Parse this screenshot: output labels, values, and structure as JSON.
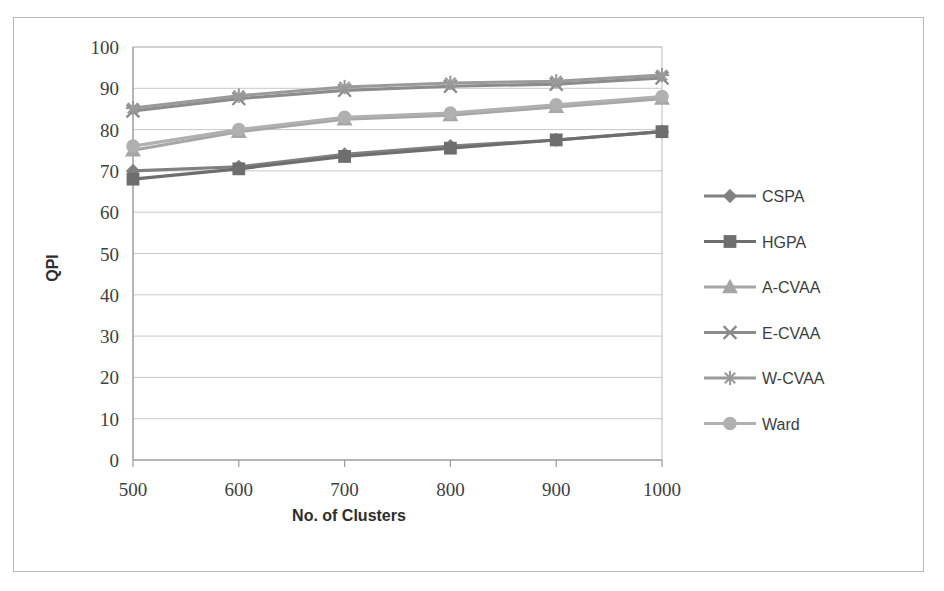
{
  "figure": {
    "has_outer_border": true,
    "background": "#ffffff"
  },
  "chart_data": {
    "type": "line",
    "title": "",
    "subtitle": "",
    "xlabel": "No. of Clusters",
    "ylabel": "QPI",
    "x": [
      500,
      600,
      700,
      800,
      900,
      1000
    ],
    "xtick_labels": [
      "500",
      "600",
      "700",
      "800",
      "900",
      "1000"
    ],
    "ytick_labels": [
      "0",
      "10",
      "20",
      "30",
      "40",
      "50",
      "60",
      "70",
      "80",
      "90",
      "100"
    ],
    "yticks": [
      0,
      10,
      20,
      30,
      40,
      50,
      60,
      70,
      80,
      90,
      100
    ],
    "ylim": [
      0,
      100
    ],
    "grid": "horizontal",
    "legend_position": "right",
    "series": [
      {
        "name": "CSPA",
        "marker": "diamond",
        "color": "#808080",
        "values": [
          70.0,
          71.0,
          74.0,
          76.0,
          77.5,
          79.5
        ]
      },
      {
        "name": "HGPA",
        "marker": "square",
        "color": "#6e6e6e",
        "values": [
          68.0,
          70.5,
          73.5,
          75.5,
          77.5,
          79.5
        ]
      },
      {
        "name": "A-CVAA",
        "marker": "triangle",
        "color": "#a6a6a6",
        "values": [
          75.0,
          79.5,
          82.5,
          83.5,
          85.5,
          87.5
        ]
      },
      {
        "name": "E-CVAA",
        "marker": "x",
        "color": "#8c8c8c",
        "values": [
          84.5,
          87.5,
          89.5,
          90.5,
          91.0,
          92.5
        ]
      },
      {
        "name": "W-CVAA",
        "marker": "asterisk",
        "color": "#9a9a9a",
        "values": [
          85.2,
          88.2,
          90.3,
          91.3,
          91.7,
          93.2
        ]
      },
      {
        "name": "Ward",
        "marker": "circle",
        "color": "#b0b0b0",
        "values": [
          76.0,
          80.0,
          83.0,
          84.0,
          86.0,
          88.0
        ]
      }
    ]
  }
}
